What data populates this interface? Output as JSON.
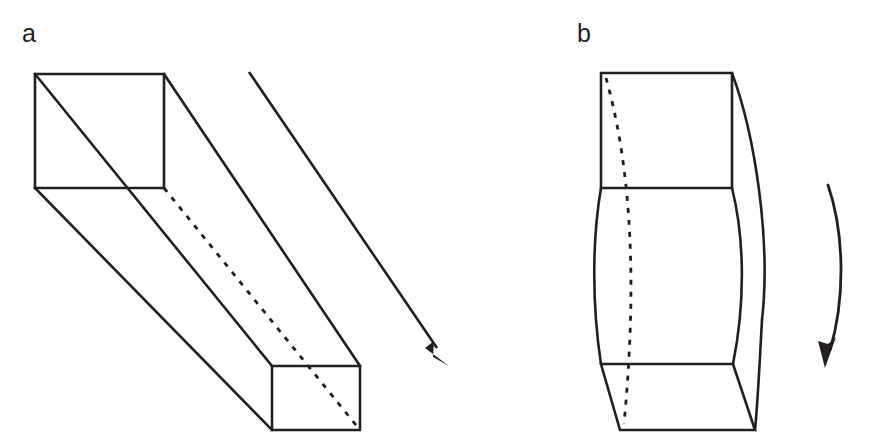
{
  "figure": {
    "caption_style": "two-panel line diagram",
    "background_color": "#ffffff",
    "ink_color": "#231f20",
    "width": 873,
    "height": 445
  },
  "panels": [
    {
      "id": "a",
      "label": "a",
      "label_x": 22,
      "label_y": 42,
      "description": "straight rectangular prism in oblique projection",
      "near_face": {
        "name": "near-square-face",
        "left": 35,
        "top": 74,
        "right": 164,
        "bottom": 188
      },
      "far_face": {
        "name": "far-square-face",
        "left": 272,
        "top": 366,
        "right": 360,
        "bottom": 430
      },
      "hidden_edge": {
        "name": "hidden-back-edge",
        "from_x": 164,
        "from_y": 188,
        "to_x": 360,
        "to_y": 430,
        "style": "dashed"
      },
      "direction_arrow": {
        "name": "extension-direction-arrow",
        "from_x": 249,
        "from_y": 72,
        "to_x": 448,
        "to_y": 364,
        "style": "straight",
        "head": "solid-triangle"
      }
    },
    {
      "id": "b",
      "label": "b",
      "label_x": 577,
      "label_y": 42,
      "description": "bent block with bowed side faces",
      "top_face": {
        "name": "top-rectangle-face",
        "left": 601,
        "top": 73,
        "right": 732,
        "bottom": 188
      },
      "bottom_face": {
        "name": "bottom-trapezoid-face",
        "top_left_x": 601,
        "top_y": 364,
        "top_right_x": 733,
        "bottom_left_x": 620,
        "bottom_y": 430,
        "bottom_right_x": 755
      },
      "hidden_edge": {
        "name": "hidden-curved-back-edge",
        "from_x": 606,
        "from_y": 78,
        "to_x": 624,
        "to_y": 424,
        "style": "dashed-curve"
      },
      "rotation_arrow": {
        "name": "bending-rotation-arrow",
        "from_x": 828,
        "from_y": 185,
        "to_x": 828,
        "to_y": 366,
        "style": "curved",
        "head": "solid-triangle"
      }
    }
  ]
}
